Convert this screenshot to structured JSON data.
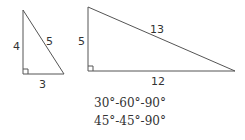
{
  "diagram": {
    "colors": {
      "stroke": "#555555",
      "text": "#333333",
      "background": "#ffffff"
    },
    "triangles": [
      {
        "name": "3-4-5 right triangle",
        "legs": {
          "vertical": "4",
          "horizontal": "3"
        },
        "hypotenuse": "5"
      },
      {
        "name": "5-12-13 right triangle",
        "legs": {
          "vertical": "5",
          "horizontal": "12"
        },
        "hypotenuse": "13"
      }
    ],
    "captions": [
      "30°-60°-90°",
      "45°-45°-90°"
    ]
  }
}
